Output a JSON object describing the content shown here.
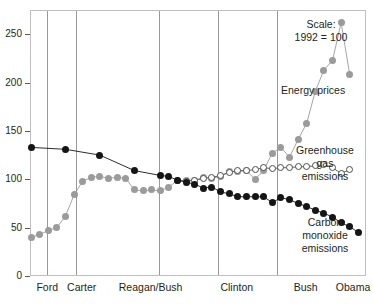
{
  "chart_data": {
    "type": "line",
    "title": "",
    "subtitle": "",
    "xlabel": "",
    "ylabel": "",
    "scale_note": "Scale:\n1992 = 100",
    "ylim": [
      0,
      275
    ],
    "yticks": [
      0,
      50,
      100,
      150,
      200,
      250
    ],
    "ytick_labels": [
      "0",
      "50",
      "100",
      "150",
      "200",
      "250"
    ],
    "xlim": [
      1973,
      2012
    ],
    "grid": false,
    "legend_position": "right-inline",
    "era_labels": [
      "Ford",
      "Carter",
      "Reagan/Bush",
      "Clinton",
      "Bush",
      "Obama"
    ],
    "era_boundaries": [
      1977,
      1981,
      1993,
      2001,
      2009
    ],
    "series": [
      {
        "name": "Energy prices",
        "marker": "filled-circle",
        "color": "#9b9b9b",
        "x": [
          1973,
          1974,
          1975,
          1976,
          1977,
          1978,
          1979,
          1980,
          1981,
          1982,
          1983,
          1984,
          1985,
          1986,
          1987,
          1988,
          1989,
          1990,
          1991,
          1992,
          1993,
          1994,
          1995,
          1996,
          1997,
          1998,
          1999,
          2000,
          2001,
          2002,
          2003,
          2004,
          2005,
          2006,
          2007,
          2008,
          2009,
          2010
        ],
        "values": [
          41,
          44,
          48,
          51,
          63,
          85,
          99,
          103,
          104,
          102,
          103,
          102,
          90,
          89,
          90,
          89,
          93,
          100,
          100,
          100,
          103,
          102,
          104,
          109,
          109,
          110,
          101,
          110,
          128,
          134,
          124,
          142,
          159,
          192,
          214,
          224,
          263,
          209
        ]
      },
      {
        "name": "Greenhouse gas emissions",
        "marker": "open-circle",
        "color": "#4d4d4d",
        "x": [
          1990,
          1991,
          1992,
          1993,
          1994,
          1995,
          1996,
          1997,
          1998,
          1999,
          2000,
          2001,
          2002,
          2003,
          2004,
          2005,
          2006,
          2007,
          2008,
          2009,
          2010
        ],
        "values": [
          100,
          99,
          100,
          102,
          103,
          105,
          108,
          110,
          110,
          111,
          113,
          112,
          113,
          113,
          114,
          114,
          115,
          116,
          113,
          107,
          111
        ]
      },
      {
        "name": "Carbon monoxide emissions",
        "marker": "filled-circle",
        "color": "#151515",
        "x": [
          1973,
          1977,
          1981,
          1985,
          1988,
          1989,
          1990,
          1991,
          1992,
          1993,
          1994,
          1995,
          1996,
          1997,
          1998,
          1999,
          2000,
          2001,
          2002,
          2003,
          2004,
          2005,
          2006,
          2007,
          2008,
          2009,
          2010,
          2011
        ],
        "values": [
          134,
          132,
          126,
          110,
          105,
          104,
          100,
          98,
          96,
          92,
          93,
          88,
          86,
          83,
          83,
          83,
          83,
          77,
          82,
          80,
          76,
          73,
          69,
          66,
          62,
          56,
          52,
          46
        ]
      }
    ]
  },
  "annotations": {
    "scale": "Scale:\n1992 = 100",
    "energy_prices": "Energy prices",
    "greenhouse": "Greenhouse\ngas\nemissions",
    "carbon_monoxide": "Carbon\nmonoxide\nemissions"
  }
}
